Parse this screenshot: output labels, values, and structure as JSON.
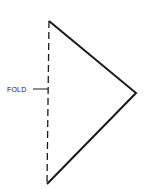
{
  "diagram": {
    "type": "fold-pattern",
    "label": "FOLD",
    "shape": "triangle",
    "vertices": {
      "top": [
        49,
        21
      ],
      "right": [
        136,
        93
      ],
      "bottom": [
        47,
        184
      ]
    },
    "fold_line": "dashed vertical line along left edge",
    "colors": {
      "stroke": "#1a1a1a",
      "background": "#ffffff"
    }
  }
}
